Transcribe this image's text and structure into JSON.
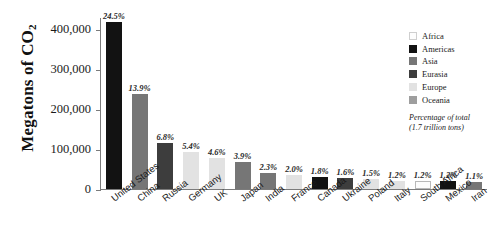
{
  "chart_data": {
    "type": "bar",
    "title": "",
    "xlabel": "",
    "ylabel": "Megatons of CO2",
    "ylabel_rich": "Megatons of CO",
    "ylabel_sub": "2",
    "ylim": [
      0,
      430000
    ],
    "ytick_values": [
      0,
      100000,
      200000,
      300000,
      400000
    ],
    "ytick_labels": [
      "0",
      "100,000",
      "200,000",
      "300,000",
      "400,000"
    ],
    "grid": false,
    "categories": [
      "United States",
      "China",
      "Russia",
      "Germany",
      "UK",
      "Japan",
      "India",
      "France",
      "Canada",
      "Ukraine",
      "Poland",
      "Italy",
      "South Africa",
      "Mexico",
      "Iran"
    ],
    "values": [
      416500,
      236300,
      115600,
      91800,
      78200,
      66300,
      39100,
      34000,
      30600,
      27200,
      25500,
      20400,
      20400,
      20400,
      18700
    ],
    "data_labels": [
      "24.5%",
      "13.9%",
      "6.8%",
      "5.4%",
      "4.6%",
      "3.9%",
      "2.3%",
      "2.0%",
      "1.8%",
      "1.6%",
      "1.5%",
      "1.2%",
      "1.2%",
      "1.2%",
      "1.1%"
    ],
    "regions": [
      "Americas",
      "Asia",
      "Eurasia",
      "Europe",
      "Europe",
      "Asia",
      "Asia",
      "Europe",
      "Americas",
      "Eurasia",
      "Europe",
      "Europe",
      "Africa",
      "Americas",
      "Asia"
    ],
    "legend_position": "right",
    "legend_entries": [
      {
        "label": "Africa",
        "color": "#fdfdfd"
      },
      {
        "label": "Americas",
        "color": "#121212"
      },
      {
        "label": "Asia",
        "color": "#767676"
      },
      {
        "label": "Eurasia",
        "color": "#3d3d3d"
      },
      {
        "label": "Europe",
        "color": "#e2e2e2"
      },
      {
        "label": "Oceania",
        "color": "#9e9e9e"
      }
    ],
    "legend_note_line1": "Percentage of total",
    "legend_note_line2": "(1.7 trillion tons)",
    "region_colors": {
      "Africa": "#fdfdfd",
      "Americas": "#121212",
      "Asia": "#767676",
      "Eurasia": "#3d3d3d",
      "Europe": "#e2e2e2",
      "Oceania": "#9e9e9e"
    },
    "axis_color": "#7b7b7b"
  }
}
